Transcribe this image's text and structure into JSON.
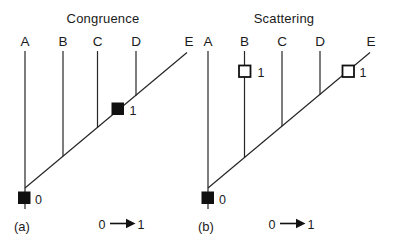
{
  "figure": {
    "background_color": "#ffffff",
    "ink_color": "#1b1b1b",
    "marker_filled_color": "#111111",
    "marker_open_fill": "#ffffff"
  },
  "panels": [
    {
      "title": "Congruence",
      "panel_label": "(a)",
      "taxa": [
        "A",
        "B",
        "C",
        "D",
        "E"
      ],
      "root_state": "0",
      "change_labels": [
        "1"
      ],
      "legend": {
        "from": "0",
        "to": "1"
      }
    },
    {
      "title": "Scattering",
      "panel_label": "(b)",
      "taxa": [
        "A",
        "B",
        "C",
        "D",
        "E"
      ],
      "root_state": "0",
      "change_labels": [
        "1",
        "1"
      ],
      "legend": {
        "from": "0",
        "to": "1"
      }
    }
  ]
}
